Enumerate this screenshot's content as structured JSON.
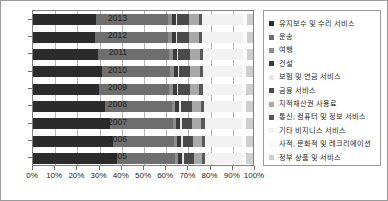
{
  "chart_data": {
    "type": "bar",
    "orientation": "horizontal",
    "stacked": true,
    "normalized": "100%",
    "title": "",
    "subtitle": "",
    "xlabel": "",
    "ylabel": "",
    "xlim": [
      0,
      100
    ],
    "grid": true,
    "legend_position": "right",
    "xticks": [
      "0%",
      "10%",
      "20%",
      "30%",
      "40%",
      "50%",
      "60%",
      "70%",
      "80%",
      "90%",
      "100%"
    ],
    "xtick_values": [
      0,
      10,
      20,
      30,
      40,
      50,
      60,
      70,
      80,
      90,
      100
    ],
    "categories": [
      "2013",
      "2012",
      "2011",
      "2010",
      "2009",
      "2008",
      "2007",
      "2006",
      "2005"
    ],
    "series": [
      {
        "name": "유지보수 및 수리 서비스",
        "color": "#2b2b2b",
        "values": [
          28.5,
          28.0,
          29.5,
          31.5,
          30.0,
          32.5,
          35.0,
          36.5,
          38.0
        ]
      },
      {
        "name": "운송",
        "color": "#6e6e6e",
        "values": [
          33.0,
          33.5,
          32.5,
          31.0,
          32.0,
          30.5,
          28.5,
          27.5,
          26.5
        ]
      },
      {
        "name": "여행",
        "color": "#8c8c8c",
        "values": [
          1.5,
          1.5,
          1.5,
          1.5,
          1.5,
          1.5,
          1.5,
          1.5,
          1.5
        ]
      },
      {
        "name": "건설",
        "color": "#3a3a3a",
        "values": [
          1.8,
          1.8,
          1.8,
          1.8,
          1.8,
          1.8,
          1.8,
          1.8,
          1.8
        ]
      },
      {
        "name": "보험 및 연금 서비스",
        "color": "#e6e6e6",
        "values": [
          0.8,
          0.8,
          0.8,
          0.8,
          0.8,
          0.8,
          0.8,
          0.8,
          0.8
        ]
      },
      {
        "name": "금융 서비스",
        "color": "#4a4a4a",
        "values": [
          5.5,
          5.5,
          5.5,
          5.0,
          5.2,
          5.0,
          4.8,
          4.6,
          4.4
        ]
      },
      {
        "name": "지적재산권 사용료",
        "color": "#a8a8a8",
        "values": [
          4.4,
          4.4,
          4.4,
          4.4,
          4.3,
          4.2,
          4.1,
          4.0,
          3.9
        ]
      },
      {
        "name": "통신, 컴퓨터 및 정보 서비스",
        "color": "#585858",
        "values": [
          1.5,
          1.5,
          1.5,
          1.5,
          1.5,
          1.5,
          1.5,
          1.5,
          1.5
        ]
      },
      {
        "name": "기타 비지니스 서비스",
        "color": "#f2f2f2",
        "values": [
          18.5,
          18.5,
          18.0,
          17.5,
          17.7,
          17.2,
          16.8,
          16.6,
          16.4
        ]
      },
      {
        "name": "사적, 문화적 및 레크리에이션",
        "color": "#fafafa",
        "values": [
          2.0,
          2.0,
          2.0,
          2.0,
          2.0,
          2.0,
          2.2,
          2.2,
          2.2
        ]
      },
      {
        "name": "정부 상품 및 서비스",
        "color": "#cfcfcf",
        "values": [
          2.5,
          2.5,
          2.5,
          3.0,
          3.2,
          3.0,
          3.0,
          3.0,
          3.0
        ]
      }
    ]
  }
}
